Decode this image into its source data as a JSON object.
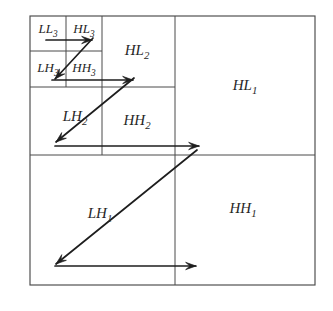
{
  "figure": {
    "background_color": "#ffffff",
    "line_color": "#4a4a4a",
    "arrow_color": "#1e1e1e",
    "text_color": "#262626"
  },
  "subbands": [
    {
      "id": "ll3",
      "base": "LL",
      "level": "3",
      "label": "LL3",
      "x": 48,
      "y": 33,
      "anchor": "middle"
    },
    {
      "id": "hl3",
      "base": "HL",
      "level": "3",
      "label": "HL3",
      "x": 84,
      "y": 33,
      "anchor": "middle"
    },
    {
      "id": "lh3",
      "base": "LH",
      "level": "3",
      "label": "LH3",
      "x": 48,
      "y": 72,
      "anchor": "middle"
    },
    {
      "id": "hh3",
      "base": "HH",
      "level": "3",
      "label": "HH3",
      "x": 84,
      "y": 72,
      "anchor": "middle"
    },
    {
      "id": "hl2",
      "base": "HL",
      "level": "2",
      "label": "HL2",
      "x": 137,
      "y": 55,
      "anchor": "middle"
    },
    {
      "id": "lh2",
      "base": "LH",
      "level": "2",
      "label": "LH2",
      "x": 75,
      "y": 121,
      "anchor": "middle"
    },
    {
      "id": "hh2",
      "base": "HH",
      "level": "2",
      "label": "HH2",
      "x": 137,
      "y": 125,
      "anchor": "middle"
    },
    {
      "id": "hl1",
      "base": "HL",
      "level": "1",
      "label": "HL1",
      "x": 245,
      "y": 90,
      "anchor": "middle"
    },
    {
      "id": "lh1",
      "base": "LH",
      "level": "1",
      "label": "LH1",
      "x": 100,
      "y": 218,
      "anchor": "middle"
    },
    {
      "id": "hh1",
      "base": "HH",
      "level": "1",
      "label": "HH1",
      "x": 243,
      "y": 213,
      "anchor": "middle"
    }
  ],
  "grid": {
    "outer": {
      "x": 30,
      "y": 16,
      "width": 285,
      "height": 269
    },
    "vertical_lines": [
      {
        "id": "v-center",
        "x": 175,
        "y1": 16,
        "y2": 285
      },
      {
        "id": "v-level2",
        "x": 102,
        "y1": 16,
        "y2": 155
      },
      {
        "id": "v-level3",
        "x": 66,
        "y1": 16,
        "y2": 87
      }
    ],
    "horizontal_lines": [
      {
        "id": "h-center",
        "y": 155,
        "x1": 30,
        "x2": 315
      },
      {
        "id": "h-level2",
        "y": 87,
        "x1": 30,
        "x2": 175
      },
      {
        "id": "h-level3",
        "y": 51,
        "x1": 30,
        "x2": 102
      }
    ]
  },
  "arrows": [
    {
      "id": "arrow-level3-horizontal",
      "direction": "right",
      "x1": 46,
      "y1": 40,
      "x2": 92,
      "y2": 40
    },
    {
      "id": "arrow-level3-diagonal",
      "direction": "down-left",
      "x1": 93,
      "y1": 38,
      "x2": 55,
      "y2": 79
    },
    {
      "id": "arrow-level2-horizontal",
      "direction": "right",
      "x1": 52,
      "y1": 80,
      "x2": 133,
      "y2": 80
    },
    {
      "id": "arrow-level2-diagonal",
      "direction": "down-left",
      "x1": 134,
      "y1": 78,
      "x2": 56,
      "y2": 142
    },
    {
      "id": "arrow-level1-horizontal",
      "direction": "right",
      "x1": 55,
      "y1": 146,
      "x2": 199,
      "y2": 146
    },
    {
      "id": "arrow-level1-diagonal",
      "direction": "down-left",
      "x1": 197,
      "y1": 150,
      "x2": 56,
      "y2": 264
    },
    {
      "id": "arrow-bottom-horizontal",
      "direction": "right",
      "x1": 55,
      "y1": 266,
      "x2": 196,
      "y2": 266
    }
  ]
}
